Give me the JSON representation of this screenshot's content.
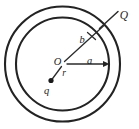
{
  "figure": {
    "background_color": "#ffffff",
    "line_color": "#232323",
    "label_color": "#1d1d1d",
    "labels": {
      "outer_charge": "Q",
      "center": "O",
      "inner_radius": "a",
      "outer_radius": "b",
      "charge_distance": "r",
      "point_charge": "q"
    },
    "geometry": {
      "center_x": 62.5,
      "center_y": 64,
      "inner_circle_radius": 47,
      "outer_circle_radius": 58,
      "inner_radius_arrow_label": "a",
      "outer_radius_line_label": "b",
      "point_charge_x": 51,
      "point_charge_y": 81
    },
    "annotations": {
      "a_arrow_description": "arrow from center O to inner circle pointing right",
      "b_line_description": "line from center O up-right to outer shell with tick mark",
      "r_line_description": "line from center O down-left to point charge q",
      "Q_leader_description": "leader line from Q label into shell annulus"
    }
  }
}
